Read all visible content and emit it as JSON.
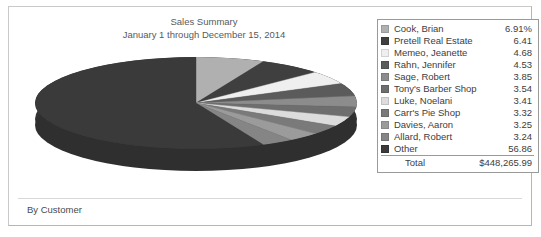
{
  "report": {
    "title_line1": "Sales Summary",
    "title_line2": "January 1 through December 15, 2014",
    "footer_label": "By Customer"
  },
  "legend": {
    "total_label": "Total",
    "total_value": "$448,265.99",
    "rows": [
      {
        "label": "Cook, Brian",
        "value": "6.91%",
        "color": "#b0b0b0"
      },
      {
        "label": "Pretell Real Estate",
        "value": "6.41",
        "color": "#3f3f3f"
      },
      {
        "label": "Memeo, Jeanette",
        "value": "4.68",
        "color": "#efefef"
      },
      {
        "label": "Rahn, Jennifer",
        "value": "4.53",
        "color": "#5b5b5b"
      },
      {
        "label": "Sage, Robert",
        "value": "3.85",
        "color": "#8c8c8c"
      },
      {
        "label": "Tony's Barber Shop",
        "value": "3.54",
        "color": "#6e6e6e"
      },
      {
        "label": "Luke, Noelani",
        "value": "3.41",
        "color": "#dcdcdc"
      },
      {
        "label": "Carr's Pie Shop",
        "value": "3.32",
        "color": "#7a7a7a"
      },
      {
        "label": "Davies, Aaron",
        "value": "3.25",
        "color": "#9b9b9b"
      },
      {
        "label": "Allard, Robert",
        "value": "3.24",
        "color": "#858585"
      },
      {
        "label": "Other",
        "value": "56.86",
        "color": "#3a3a3a"
      }
    ]
  },
  "chart_data": {
    "type": "pie",
    "title": "Sales Summary",
    "subtitle": "January 1 through December 15, 2014",
    "xlabel": "",
    "ylabel": "",
    "legend_position": "right",
    "grid": false,
    "units": "percent",
    "total": "$448,265.99",
    "categories": [
      "Cook, Brian",
      "Pretell Real Estate",
      "Memeo, Jeanette",
      "Rahn, Jennifer",
      "Sage, Robert",
      "Tony's Barber Shop",
      "Luke, Noelani",
      "Carr's Pie Shop",
      "Davies, Aaron",
      "Allard, Robert",
      "Other"
    ],
    "values": [
      6.91,
      6.41,
      4.68,
      4.53,
      3.85,
      3.54,
      3.41,
      3.32,
      3.25,
      3.24,
      56.86
    ],
    "colors": [
      "#b0b0b0",
      "#3f3f3f",
      "#efefef",
      "#5b5b5b",
      "#8c8c8c",
      "#6e6e6e",
      "#dcdcdc",
      "#7a7a7a",
      "#9b9b9b",
      "#858585",
      "#3a3a3a"
    ]
  }
}
